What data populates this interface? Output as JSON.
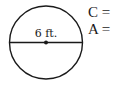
{
  "diagram": {
    "shape": "circle",
    "center": {
      "x": 46,
      "y": 42.5
    },
    "radius": 37,
    "diameter_label": "6 ft.",
    "stroke_color": "#1a1a1a",
    "show_center_point": true
  },
  "formulas": [
    {
      "label": "C ="
    },
    {
      "label": "A ="
    }
  ]
}
